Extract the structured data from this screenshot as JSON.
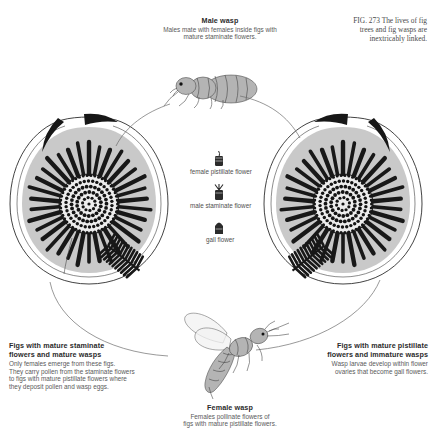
{
  "figure": {
    "number": "FIG. 273",
    "caption_lines": [
      "FIG. 273  The lives of fig",
      "trees and fig wasps are",
      "inextricably linked."
    ],
    "caption_full": "FIG. 273 The lives of fig trees and fig wasps are inextricably linked."
  },
  "male_wasp": {
    "title": "Male wasp",
    "caption_lines": [
      "Males mate with females inside figs with",
      "mature staminate flowers."
    ],
    "caption_full": "Males mate with females inside figs with mature staminate flowers."
  },
  "female_wasp": {
    "title": "Female wasp",
    "caption_lines": [
      "Females pollinate flowers of",
      "figs with mature pistillate flowers."
    ],
    "caption_full": "Females pollinate flowers of figs with mature pistillate flowers."
  },
  "left_fig": {
    "title_lines": [
      "Figs with mature staminate",
      "flowers and mature wasps"
    ],
    "title_full": "Figs with mature staminate flowers and mature wasps",
    "caption_lines": [
      "Only females emerge from these figs.",
      "They carry pollen from the staminate flowers",
      "to figs with mature pistillate flowers where",
      "they deposit pollen and wasp eggs."
    ],
    "caption_full": "Only females emerge from these figs. They carry pollen from the staminate flowers to figs with mature pistillate flowers where they deposit pollen and wasp eggs."
  },
  "right_fig": {
    "title_lines": [
      "Figs with mature pistillate",
      "flowers and immature wasps"
    ],
    "title_full": "Figs with mature pistillate flowers and immature wasps",
    "caption_lines": [
      "Wasp larvae develop within flower",
      "ovaries that become gall flowers."
    ],
    "caption_full": "Wasp larvae develop within flower ovaries that become gall flowers."
  },
  "flower_legend": {
    "items": [
      {
        "label": "female pistillate flower",
        "icon": "pistillate-flower-icon"
      },
      {
        "label": "male staminate flower",
        "icon": "staminate-flower-icon"
      },
      {
        "label": "gall flower",
        "icon": "gall-flower-icon"
      }
    ]
  },
  "colors": {
    "ink": "#2b2b2b",
    "caption": "#5a5a5a",
    "flesh": "#c9c9c9",
    "flower": "#141414",
    "arc": "#6d6d6d",
    "background": "#ffffff"
  }
}
